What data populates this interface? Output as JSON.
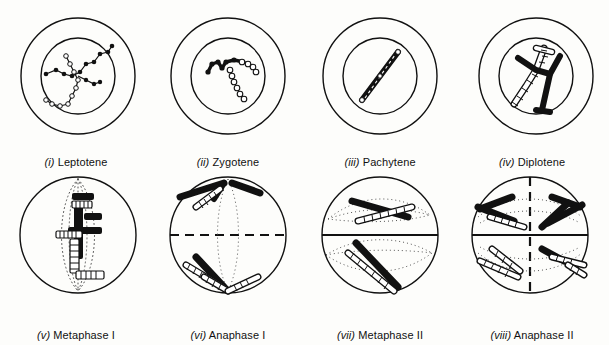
{
  "figure": {
    "background_color": "#fdfdfb",
    "ink_color": "#111111",
    "rows": 2,
    "columns": 4
  },
  "panels": [
    {
      "id": "leptotene",
      "num": "(i)",
      "label": "Leptotene",
      "stage_group": "Prophase I",
      "has_nucleus": true,
      "division_line": "none",
      "spindle": "none",
      "chromosome_style": "beaded-threads",
      "chromosome_count": "long thin beaded threads, filled and open beads"
    },
    {
      "id": "zygotene",
      "num": "(ii)",
      "label": "Zygotene",
      "stage_group": "Prophase I",
      "has_nucleus": true,
      "division_line": "none",
      "spindle": "none",
      "chromosome_style": "paired-beaded-threads",
      "chromosome_count": "homologues pairing, one solid one open"
    },
    {
      "id": "pachytene",
      "num": "(iii)",
      "label": "Pachytene",
      "stage_group": "Prophase I",
      "has_nucleus": true,
      "division_line": "none",
      "spindle": "none",
      "chromosome_style": "condensed-bivalent",
      "chromosome_count": "single thick bivalent"
    },
    {
      "id": "diplotene",
      "num": "(iv)",
      "label": "Diplotene",
      "stage_group": "Prophase I",
      "has_nucleus": true,
      "division_line": "none",
      "spindle": "none",
      "chromosome_style": "chiasma-crossover",
      "chromosome_count": "one solid and one ladder chromosome crossed at chiasma"
    },
    {
      "id": "metaphase-1",
      "num": "(v)",
      "label": "Metaphase I",
      "stage_group": "Meiosis I",
      "has_nucleus": false,
      "division_line": "none",
      "spindle": "vertical-dotted",
      "chromosome_style": "solid-and-ladder-bars",
      "chromosome_count": "bivalents aligned on equator"
    },
    {
      "id": "anaphase-1",
      "num": "(vi)",
      "label": "Anaphase I",
      "stage_group": "Meiosis I",
      "has_nucleus": false,
      "division_line": "horizontal-dashed",
      "spindle": "vertical-dotted",
      "chromosome_style": "solid-and-ladder-bars",
      "chromosome_count": "homologues moving to opposite poles"
    },
    {
      "id": "metaphase-2",
      "num": "(vii)",
      "label": "Metaphase II",
      "stage_group": "Meiosis II",
      "has_nucleus": false,
      "division_line": "horizontal-solid",
      "spindle": "horizontal-dotted-both-cells",
      "chromosome_style": "solid-and-ladder-bars",
      "chromosome_count": "one chromosome per daughter cell on plate"
    },
    {
      "id": "anaphase-2",
      "num": "(viii)",
      "label": "Anaphase II",
      "stage_group": "Meiosis II",
      "has_nucleus": false,
      "division_line": "horizontal-solid-plus-vertical-dashed",
      "spindle": "horizontal-dotted-both-cells",
      "chromosome_style": "solid-and-ladder-bars",
      "chromosome_count": "chromatids separating to four poles"
    }
  ]
}
